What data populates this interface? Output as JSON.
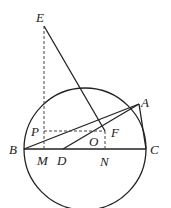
{
  "diagram": {
    "type": "geometry",
    "points": {
      "E": "E",
      "A": "A",
      "P": "P",
      "F": "F",
      "O": "O",
      "B": "B",
      "C": "C",
      "M": "M",
      "D": "D",
      "N": "N"
    },
    "segments": [
      {
        "from": "B",
        "to": "C",
        "style": "solid"
      },
      {
        "from": "B",
        "to": "A",
        "style": "solid"
      },
      {
        "from": "A",
        "to": "C",
        "style": "solid"
      },
      {
        "from": "D",
        "to": "A",
        "style": "solid"
      },
      {
        "from": "E",
        "to": "F",
        "style": "solid"
      },
      {
        "from": "E",
        "to": "M",
        "style": "dashed"
      },
      {
        "from": "P",
        "to": "F",
        "style": "dashed"
      },
      {
        "from": "F",
        "to": "N",
        "style": "dashed"
      }
    ]
  }
}
